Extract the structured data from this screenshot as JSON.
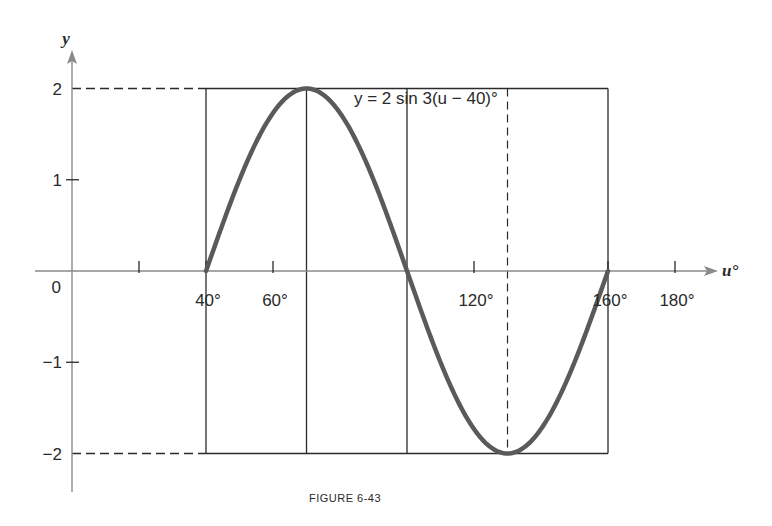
{
  "figure": {
    "caption": "FIGURE 6-43",
    "equation_label": "y = 2 sin 3(u − 40)°"
  },
  "axes": {
    "x_label": "u°",
    "y_label": "y",
    "x_ticks": [
      {
        "value": 20,
        "label": ""
      },
      {
        "value": 40,
        "label": "40°"
      },
      {
        "value": 60,
        "label": "60°"
      },
      {
        "value": 120,
        "label": "120°"
      },
      {
        "value": 160,
        "label": "160°"
      },
      {
        "value": 180,
        "label": "180°"
      }
    ],
    "y_ticks": [
      {
        "value": 2,
        "label": "2"
      },
      {
        "value": 1,
        "label": "1"
      },
      {
        "value": 0,
        "label": "0"
      },
      {
        "value": -1,
        "label": "−1"
      },
      {
        "value": -2,
        "label": "−2"
      }
    ]
  },
  "colors": {
    "curve": "#5a5a5a",
    "axis": "#8a8a8a",
    "grid": "#2a2a2a",
    "text": "#2a2a2a"
  },
  "chart_data": {
    "type": "line",
    "title": "",
    "caption": "FIGURE 6-43",
    "annotation": "y = 2 sin 3(u − 40)°",
    "xlabel": "u°",
    "ylabel": "y",
    "xlim": [
      0,
      190
    ],
    "ylim": [
      -2.5,
      2.5
    ],
    "x_tick_labels": [
      "40°",
      "60°",
      "120°",
      "160°",
      "180°"
    ],
    "y_tick_labels": [
      "2",
      "1",
      "0",
      "−1",
      "−2"
    ],
    "grid": false,
    "reference_lines": {
      "vertical_solid": [
        40,
        70,
        100,
        160
      ],
      "vertical_dashed": [
        130
      ],
      "horizontal_box": [
        2,
        -2
      ],
      "horizontal_dashed_to_axis": [
        2,
        -2
      ]
    },
    "series": [
      {
        "name": "y = 2 sin 3(u − 40)°",
        "x": [
          40,
          50,
          60,
          70,
          80,
          90,
          100,
          110,
          120,
          130,
          140,
          150,
          160
        ],
        "y": [
          0,
          1.0,
          1.73,
          2,
          1.73,
          1.0,
          0,
          -1.0,
          -1.73,
          -2,
          -1.73,
          -1.0,
          0
        ]
      }
    ],
    "key_points": [
      {
        "u": 40,
        "y": 0
      },
      {
        "u": 70,
        "y": 2
      },
      {
        "u": 100,
        "y": 0
      },
      {
        "u": 130,
        "y": -2
      },
      {
        "u": 160,
        "y": 0
      }
    ]
  }
}
